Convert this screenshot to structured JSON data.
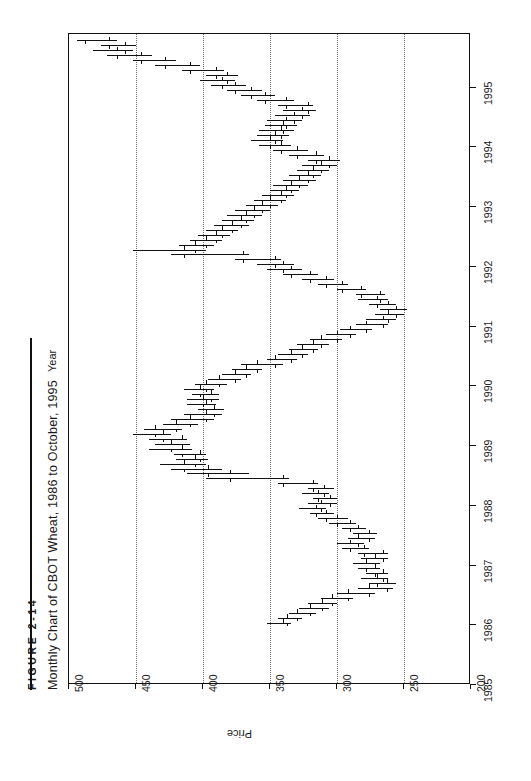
{
  "figure": {
    "number": "FIGURE 2-14",
    "title": "Monthly Chart of CBOT Wheat, 1986 to October, 1995"
  },
  "chart_data": {
    "type": "bar",
    "subtype": "ohlc-bar",
    "orientation": "rotated-90-ccw",
    "title": "Monthly Chart of CBOT Wheat, 1986 to October, 1995",
    "xlabel": "Year",
    "ylabel": "Price",
    "xlim": [
      1985,
      1995.9
    ],
    "ylim": [
      200,
      500
    ],
    "xticks": [
      1985,
      1986,
      1987,
      1988,
      1989,
      1990,
      1991,
      1992,
      1993,
      1994,
      1995
    ],
    "xtick_labels": [
      "1985",
      "1986",
      "1987",
      "1988",
      "1989",
      "1990",
      "1991",
      "1992",
      "1993",
      "1994",
      "1995"
    ],
    "yticks": [
      500,
      450,
      400,
      350,
      300,
      250,
      200
    ],
    "ytick_labels": [
      "500",
      "450",
      "400",
      "350",
      "300",
      "250",
      "200"
    ],
    "grid": "dotted-vertical-at-price-ticks",
    "legend": "none",
    "series_name": "CBOT Wheat monthly OHLC",
    "columns": [
      "date",
      "open",
      "high",
      "low",
      "close"
    ],
    "bars": [
      [
        "1986-01",
        340,
        352,
        334,
        337
      ],
      [
        "1986-02",
        337,
        344,
        326,
        330
      ],
      [
        "1986-03",
        330,
        336,
        316,
        320
      ],
      [
        "1986-04",
        320,
        328,
        306,
        311
      ],
      [
        "1986-05",
        311,
        322,
        300,
        304
      ],
      [
        "1986-06",
        304,
        312,
        288,
        292
      ],
      [
        "1986-07",
        292,
        300,
        272,
        276
      ],
      [
        "1986-08",
        276,
        284,
        258,
        263
      ],
      [
        "1986-09",
        263,
        276,
        256,
        270
      ],
      [
        "1986-10",
        270,
        282,
        262,
        266
      ],
      [
        "1986-11",
        266,
        278,
        262,
        272
      ],
      [
        "1986-12",
        272,
        284,
        268,
        278
      ],
      [
        "1987-01",
        278,
        288,
        268,
        272
      ],
      [
        "1987-02",
        272,
        282,
        262,
        266
      ],
      [
        "1987-03",
        266,
        284,
        262,
        280
      ],
      [
        "1987-04",
        280,
        296,
        276,
        290
      ],
      [
        "1987-05",
        290,
        300,
        280,
        284
      ],
      [
        "1987-06",
        284,
        292,
        272,
        276
      ],
      [
        "1987-07",
        276,
        288,
        270,
        284
      ],
      [
        "1987-08",
        284,
        296,
        278,
        290
      ],
      [
        "1987-09",
        290,
        306,
        286,
        300
      ],
      [
        "1987-10",
        300,
        314,
        292,
        308
      ],
      [
        "1987-11",
        308,
        320,
        302,
        316
      ],
      [
        "1987-12",
        316,
        328,
        308,
        312
      ],
      [
        "1988-01",
        312,
        322,
        300,
        305
      ],
      [
        "1988-02",
        305,
        318,
        300,
        314
      ],
      [
        "1988-03",
        314,
        326,
        306,
        310
      ],
      [
        "1988-04",
        310,
        322,
        302,
        318
      ],
      [
        "1988-05",
        318,
        344,
        314,
        340
      ],
      [
        "1988-06",
        340,
        398,
        336,
        380
      ],
      [
        "1988-07",
        380,
        412,
        366,
        396
      ],
      [
        "1988-08",
        396,
        424,
        386,
        414
      ],
      [
        "1988-09",
        414,
        432,
        398,
        406
      ],
      [
        "1988-10",
        406,
        420,
        396,
        402
      ],
      [
        "1988-11",
        402,
        422,
        398,
        416
      ],
      [
        "1988-12",
        416,
        440,
        408,
        424
      ],
      [
        "1989-01",
        424,
        436,
        410,
        416
      ],
      [
        "1989-02",
        416,
        440,
        412,
        430
      ],
      [
        "1989-03",
        430,
        452,
        424,
        436
      ],
      [
        "1989-04",
        436,
        444,
        416,
        420
      ],
      [
        "1989-05",
        420,
        430,
        404,
        410
      ],
      [
        "1989-06",
        410,
        424,
        392,
        398
      ],
      [
        "1989-07",
        398,
        414,
        386,
        392
      ],
      [
        "1989-08",
        392,
        404,
        384,
        398
      ],
      [
        "1989-09",
        398,
        412,
        390,
        400
      ],
      [
        "1989-10",
        400,
        412,
        388,
        394
      ],
      [
        "1989-11",
        394,
        408,
        388,
        402
      ],
      [
        "1989-12",
        402,
        414,
        392,
        398
      ],
      [
        "1990-01",
        398,
        406,
        382,
        388
      ],
      [
        "1990-02",
        388,
        396,
        372,
        376
      ],
      [
        "1990-03",
        376,
        386,
        364,
        368
      ],
      [
        "1990-04",
        368,
        378,
        356,
        360
      ],
      [
        "1990-05",
        360,
        372,
        340,
        346
      ],
      [
        "1990-06",
        346,
        352,
        330,
        334
      ],
      [
        "1990-07",
        334,
        344,
        322,
        326
      ],
      [
        "1990-08",
        326,
        336,
        314,
        318
      ],
      [
        "1990-09",
        318,
        330,
        306,
        312
      ],
      [
        "1990-10",
        312,
        320,
        296,
        300
      ],
      [
        "1990-11",
        300,
        308,
        286,
        290
      ],
      [
        "1990-12",
        290,
        298,
        274,
        278
      ],
      [
        "1991-01",
        278,
        286,
        262,
        266
      ],
      [
        "1991-02",
        266,
        278,
        256,
        262
      ],
      [
        "1991-03",
        262,
        272,
        250,
        256
      ],
      [
        "1991-04",
        256,
        268,
        248,
        262
      ],
      [
        "1991-05",
        262,
        276,
        256,
        270
      ],
      [
        "1991-06",
        270,
        284,
        262,
        268
      ],
      [
        "1991-07",
        268,
        286,
        264,
        282
      ],
      [
        "1991-08",
        282,
        300,
        278,
        296
      ],
      [
        "1991-09",
        296,
        314,
        292,
        308
      ],
      [
        "1991-10",
        308,
        326,
        302,
        320
      ],
      [
        "1991-11",
        320,
        340,
        314,
        334
      ],
      [
        "1991-12",
        334,
        352,
        326,
        340
      ],
      [
        "1992-01",
        340,
        360,
        332,
        346
      ],
      [
        "1992-02",
        346,
        376,
        342,
        370
      ],
      [
        "1992-03",
        370,
        424,
        366,
        414
      ],
      [
        "1992-04",
        414,
        452,
        398,
        406
      ],
      [
        "1992-05",
        406,
        418,
        392,
        398
      ],
      [
        "1992-06",
        398,
        410,
        386,
        390
      ],
      [
        "1992-07",
        390,
        404,
        380,
        386
      ],
      [
        "1992-08",
        386,
        398,
        374,
        378
      ],
      [
        "1992-09",
        378,
        392,
        366,
        372
      ],
      [
        "1992-10",
        372,
        386,
        362,
        368
      ],
      [
        "1992-11",
        368,
        382,
        356,
        362
      ],
      [
        "1992-12",
        362,
        376,
        350,
        356
      ],
      [
        "1993-01",
        356,
        368,
        344,
        350
      ],
      [
        "1993-02",
        350,
        362,
        338,
        342
      ],
      [
        "1993-03",
        342,
        356,
        332,
        338
      ],
      [
        "1993-04",
        338,
        350,
        328,
        334
      ],
      [
        "1993-05",
        334,
        348,
        322,
        328
      ],
      [
        "1993-06",
        328,
        340,
        316,
        322
      ],
      [
        "1993-07",
        322,
        336,
        312,
        318
      ],
      [
        "1993-08",
        318,
        330,
        306,
        312
      ],
      [
        "1993-09",
        312,
        326,
        300,
        306
      ],
      [
        "1993-10",
        306,
        322,
        298,
        316
      ],
      [
        "1993-11",
        316,
        336,
        310,
        330
      ],
      [
        "1993-12",
        330,
        348,
        322,
        342
      ],
      [
        "1994-01",
        342,
        358,
        334,
        350
      ],
      [
        "1994-02",
        350,
        364,
        340,
        346
      ],
      [
        "1994-03",
        346,
        360,
        336,
        342
      ],
      [
        "1994-04",
        342,
        358,
        332,
        340
      ],
      [
        "1994-05",
        340,
        354,
        330,
        338
      ],
      [
        "1994-06",
        338,
        352,
        326,
        332
      ],
      [
        "1994-07",
        332,
        346,
        320,
        326
      ],
      [
        "1994-08",
        326,
        340,
        316,
        322
      ],
      [
        "1994-09",
        322,
        344,
        318,
        338
      ],
      [
        "1994-10",
        338,
        360,
        332,
        354
      ],
      [
        "1994-11",
        354,
        372,
        346,
        364
      ],
      [
        "1994-12",
        364,
        382,
        356,
        376
      ],
      [
        "1995-01",
        376,
        394,
        368,
        386
      ],
      [
        "1995-02",
        386,
        402,
        376,
        382
      ],
      [
        "1995-03",
        382,
        398,
        374,
        390
      ],
      [
        "1995-04",
        390,
        416,
        384,
        410
      ],
      [
        "1995-05",
        410,
        436,
        402,
        428
      ],
      [
        "1995-06",
        428,
        452,
        420,
        446
      ],
      [
        "1995-07",
        446,
        472,
        438,
        464
      ],
      [
        "1995-08",
        464,
        482,
        452,
        458
      ],
      [
        "1995-09",
        458,
        476,
        450,
        470
      ],
      [
        "1995-10",
        470,
        494,
        464,
        488
      ]
    ]
  }
}
